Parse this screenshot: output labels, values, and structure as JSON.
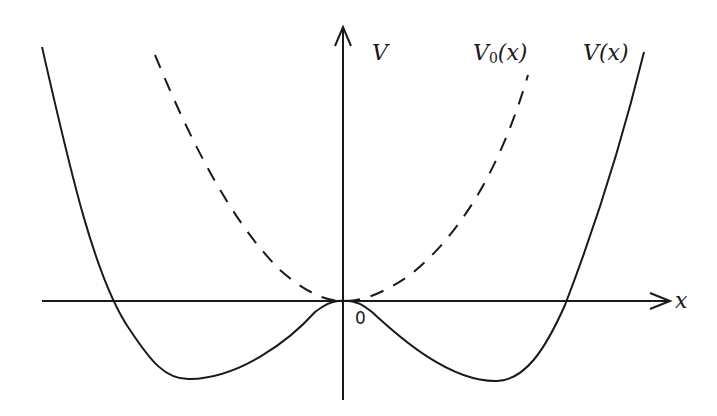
{
  "figure": {
    "type": "potential-diagram",
    "labels": {
      "y_axis": "V",
      "x_axis": "x",
      "origin": "0",
      "curve_dashed": {
        "base": "V",
        "subscript": "0",
        "arg": "(x)"
      },
      "curve_solid": "V(x)"
    },
    "curves": [
      {
        "name": "V0(x)",
        "style": "dashed",
        "shape": "parabola with minimum at origin"
      },
      {
        "name": "V(x)",
        "style": "solid",
        "shape": "double-well with local maximum at origin and two minima below the x-axis"
      }
    ],
    "colors": {
      "ink": "#1a1a1a",
      "background": "#ffffff"
    }
  }
}
